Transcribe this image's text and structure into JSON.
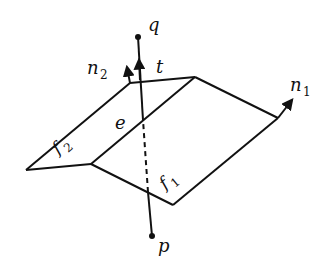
{
  "diagram": {
    "type": "geometry-figure",
    "labels": {
      "q": "q",
      "t": "t",
      "n2_base": "n",
      "n2_sub": "2",
      "n1_base": "n",
      "n1_sub": "1",
      "e": "e",
      "f2_base": "f",
      "f2_sub": "2",
      "f1_base": "f",
      "f1_sub": "1",
      "p": "p"
    },
    "points": {
      "q": [
        138,
        37
      ],
      "p": [
        152,
        236
      ],
      "e": [
        143,
        120
      ],
      "ridge_top_left": [
        130,
        83
      ],
      "ridge_top_right": [
        195,
        77
      ],
      "right_corner": [
        278,
        118
      ],
      "left_corner": [
        26,
        170
      ],
      "ridge_bottom": [
        91,
        164
      ],
      "bottom_corner": [
        173,
        205
      ],
      "line_exit": [
        148,
        192
      ]
    },
    "colors": {
      "stroke": "#111111",
      "background": "#ffffff"
    }
  }
}
